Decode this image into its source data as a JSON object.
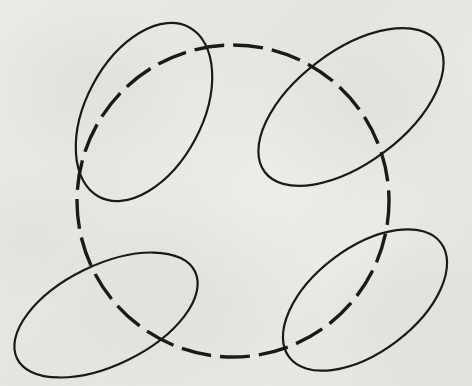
{
  "figure": {
    "medium": "ink on off-white paper",
    "canvas": {
      "width": 472,
      "height": 386
    },
    "colors": {
      "paper": "#f4f3f1",
      "ink": "#1b1b1b",
      "paper_shadow": "#eeedea",
      "paper_highlight": "#f7f6f4"
    },
    "shapes": [
      {
        "name": "dashed-circle",
        "kind": "circle",
        "style": "dashed",
        "cx": 233,
        "cy": 201,
        "r": 156,
        "rotation": 0,
        "stroke_width": 3.4,
        "dash_length": 30,
        "dash_gap": 9,
        "dash_offset": 6
      },
      {
        "name": "ellipse-top-left",
        "kind": "ellipse",
        "style": "solid",
        "cx": 144,
        "cy": 112,
        "rx": 96,
        "ry": 58,
        "rotation": -62,
        "stroke_width": 2.2
      },
      {
        "name": "ellipse-top-right",
        "kind": "ellipse",
        "style": "solid",
        "cx": 351,
        "cy": 107,
        "rx": 108,
        "ry": 56,
        "rotation": -37,
        "stroke_width": 2.2
      },
      {
        "name": "ellipse-bottom-left",
        "kind": "ellipse",
        "style": "solid",
        "cx": 106,
        "cy": 315,
        "rx": 99,
        "ry": 50,
        "rotation": -26,
        "stroke_width": 2.2
      },
      {
        "name": "ellipse-bottom-right",
        "kind": "ellipse",
        "style": "solid",
        "cx": 365,
        "cy": 300,
        "rx": 95,
        "ry": 52,
        "rotation": -37,
        "stroke_width": 2.2
      }
    ]
  }
}
